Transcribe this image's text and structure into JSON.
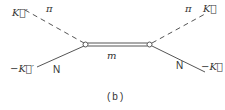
{
  "diagram": {
    "caption": "(b)",
    "labels": {
      "top_left_momentum": "K⃗′",
      "top_left_particle": "π",
      "bottom_left_momentum": "−K⃗′",
      "bottom_left_particle": "N",
      "top_right_particle": "π",
      "top_right_momentum": "K⃗",
      "bottom_right_particle": "N",
      "bottom_right_momentum": "−K⃗",
      "propagator": "m"
    },
    "lines": [
      {
        "name": "incoming-pion",
        "style": "dashed",
        "from": [
          25,
          10
        ],
        "to": [
          85,
          44
        ]
      },
      {
        "name": "incoming-nucleon",
        "style": "solid",
        "from": [
          37,
          67
        ],
        "to": [
          85,
          45
        ]
      },
      {
        "name": "propagator",
        "style": "double",
        "from": [
          85,
          44
        ],
        "to": [
          150,
          44
        ]
      },
      {
        "name": "outgoing-pion",
        "style": "dashed",
        "from": [
          150,
          44
        ],
        "to": [
          205,
          14
        ]
      },
      {
        "name": "outgoing-nucleon",
        "style": "solid",
        "from": [
          150,
          45
        ],
        "to": [
          205,
          72
        ]
      }
    ],
    "vertices": [
      [
        85,
        44
      ],
      [
        150,
        44
      ]
    ],
    "colors": {
      "line": "#555555",
      "text": "#333333"
    }
  }
}
